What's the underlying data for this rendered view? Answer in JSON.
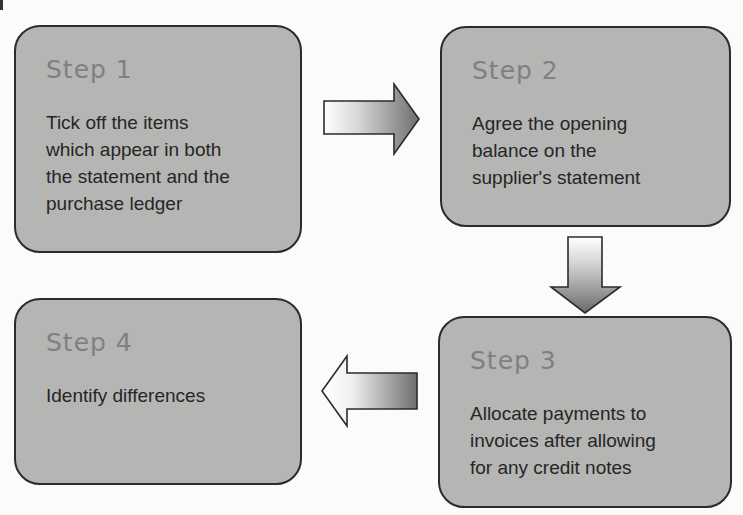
{
  "diagram": {
    "type": "process-flow",
    "colors": {
      "box_fill": "#b5b5b3",
      "box_border": "#2b2b2b",
      "title_text": "#808080",
      "body_text": "#262626",
      "arrow_light": "#ffffff",
      "arrow_dark": "#6e6e6e"
    },
    "steps": [
      {
        "title": "Step 1",
        "text": "Tick off the items\nwhich appear in both\nthe statement and the\npurchase ledger"
      },
      {
        "title": "Step 2",
        "text": "Agree the opening\nbalance on the\nsupplier's statement"
      },
      {
        "title": "Step 3",
        "text": "Allocate payments to\ninvoices after allowing\nfor any credit notes"
      },
      {
        "title": "Step 4",
        "text": "Identify differences"
      }
    ],
    "arrows": [
      {
        "from": "Step 1",
        "to": "Step 2",
        "direction": "right"
      },
      {
        "from": "Step 2",
        "to": "Step 3",
        "direction": "down"
      },
      {
        "from": "Step 3",
        "to": "Step 4",
        "direction": "left"
      }
    ]
  }
}
